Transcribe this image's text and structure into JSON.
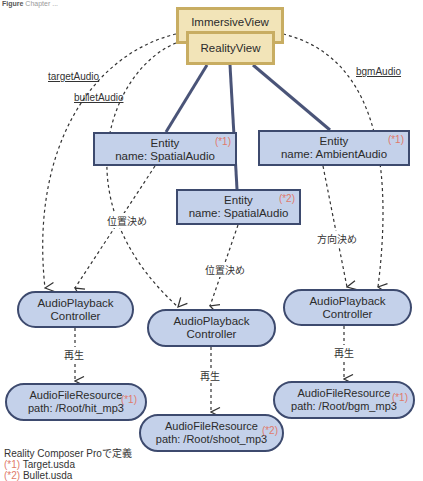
{
  "caption": {
    "prefix": "Figure",
    "text": "Chapter ..."
  },
  "views": {
    "immersive": "ImmersiveView",
    "reality": "RealityView"
  },
  "relations": {
    "target_audio": "targetAudio",
    "bullet_audio": "bulletAudio",
    "bgm_audio": "bgmAudio",
    "positioning_1": "位置決め",
    "positioning_2": "位置決め",
    "orientation": "方向決め",
    "play_1": "再生",
    "play_2": "再生",
    "play_3": "再生"
  },
  "entities": [
    {
      "title": "Entity",
      "name": "name: SpatialAudio",
      "mark": "(*1)"
    },
    {
      "title": "Entity",
      "name": "name: SpatialAudio",
      "mark": "(*2)"
    },
    {
      "title": "Entity",
      "name": "name: AmbientAudio",
      "mark": "(*1)"
    }
  ],
  "controllers": [
    {
      "line1": "AudioPlayback",
      "line2": "Controller"
    },
    {
      "line1": "AudioPlayback",
      "line2": "Controller"
    },
    {
      "line1": "AudioPlayback",
      "line2": "Controller"
    }
  ],
  "resources": [
    {
      "title": "AudioFileResource",
      "path": "path: /Root/hit_mp3",
      "mark": "(*1)"
    },
    {
      "title": "AudioFileResource",
      "path": "path: /Root/shoot_mp3",
      "mark": "(*2)"
    },
    {
      "title": "AudioFileResource",
      "path": "path: /Root/bgm_mp3",
      "mark": "(*1)"
    }
  ],
  "legend": {
    "heading": "Reality Composer Proで定義",
    "items": [
      {
        "mark": "(*1)",
        "text": " Target.usda"
      },
      {
        "mark": "(*2)",
        "text": " Bullet.usda"
      }
    ]
  },
  "colors": {
    "view_fill": "#f2e4b8",
    "view_border": "#c8ad62",
    "node_fill": "#c4d1ea",
    "node_border": "#3d4a6e",
    "mark": "#e07a6a"
  }
}
